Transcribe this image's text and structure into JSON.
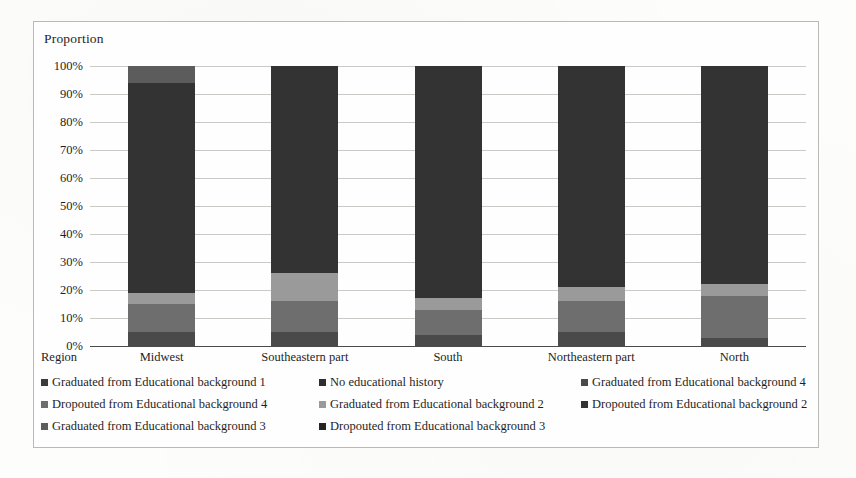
{
  "chart_data": {
    "type": "bar",
    "subtype": "100% stacked column",
    "title": "",
    "ylabel": "Proportion",
    "xlabel": "Region",
    "ylim": [
      0,
      100
    ],
    "ytick_labels": [
      "100%",
      "90%",
      "80%",
      "70%",
      "60%",
      "50%",
      "40%",
      "30%",
      "20%",
      "10%",
      "0%"
    ],
    "ytick_values": [
      100,
      90,
      80,
      70,
      60,
      50,
      40,
      30,
      20,
      10,
      0
    ],
    "grid": true,
    "legend_position": "bottom",
    "categories": [
      "Midwest",
      "Southeastern part",
      "South",
      "Northeastern part",
      "North"
    ],
    "series": [
      {
        "name": "Graduated from Educational background 1",
        "color": "#3b3b3b",
        "values": [
          0.0,
          0.0,
          0.0,
          0.0,
          0.0
        ]
      },
      {
        "name": "No educational history",
        "color": "#2e2e2e",
        "values": [
          0.0,
          0.0,
          0.0,
          0.0,
          0.0
        ]
      },
      {
        "name": "Graduated from Educational background 4",
        "color": "#4a4a4a",
        "values": [
          5.0,
          5.0,
          4.0,
          5.0,
          3.0
        ]
      },
      {
        "name": "Dropouted from Educational background 4",
        "color": "#6e6e6e",
        "values": [
          10.0,
          11.0,
          9.0,
          11.0,
          15.0
        ]
      },
      {
        "name": "Graduated from Educational background 2",
        "color": "#9a9a9a",
        "values": [
          4.0,
          10.0,
          4.0,
          5.0,
          4.0
        ]
      },
      {
        "name": "Dropouted from Educational background 2",
        "color": "#333333",
        "values": [
          75.0,
          74.0,
          83.0,
          79.0,
          78.0
        ]
      },
      {
        "name": "Graduated from Educational background 3",
        "color": "#5c5c5c",
        "values": [
          6.0,
          0.0,
          0.0,
          0.0,
          0.0
        ]
      },
      {
        "name": "Dropouted from Educational background 3",
        "color": "#242424",
        "values": [
          0.0,
          0.0,
          0.0,
          0.0,
          0.0
        ]
      }
    ]
  },
  "legend": {
    "rows": [
      [
        {
          "label": "Graduated from Educational background 1",
          "color": "#3b3b3b"
        },
        {
          "label": "No educational history",
          "color": "#2e2e2e"
        },
        {
          "label": "Graduated from Educational background 4",
          "color": "#4a4a4a"
        }
      ],
      [
        {
          "label": "Dropouted from Educational background 4",
          "color": "#6e6e6e"
        },
        {
          "label": "Graduated from Educational background 2",
          "color": "#9a9a9a"
        },
        {
          "label": "Dropouted from Educational background 2",
          "color": "#333333"
        }
      ],
      [
        {
          "label": "Graduated from Educational background 3",
          "color": "#5c5c5c"
        },
        {
          "label": "Dropouted from Educational background 3",
          "color": "#242424"
        }
      ]
    ]
  }
}
